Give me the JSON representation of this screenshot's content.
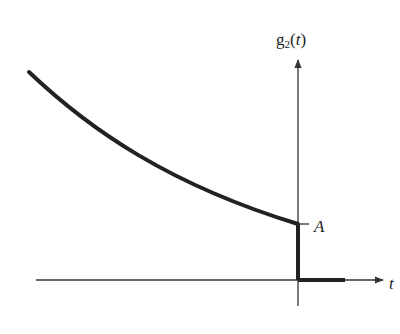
{
  "diagram": {
    "y_axis_label": "g",
    "y_axis_subscript": "2",
    "y_axis_arg_open": "(",
    "y_axis_arg": "t",
    "y_axis_arg_close": ")",
    "x_axis_label": "t",
    "level_label": "A"
  },
  "colors": {
    "curve": "#222222",
    "axes": "#333333",
    "background": "#ffffff"
  }
}
